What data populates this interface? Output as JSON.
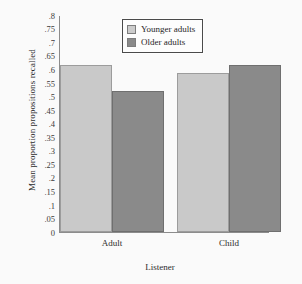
{
  "chart_data": {
    "type": "bar",
    "title": "",
    "xlabel": "Listener",
    "ylabel": "Mean proportion propositions recalled",
    "categories": [
      "Adult",
      "Child"
    ],
    "series": [
      {
        "name": "Younger adults",
        "color": "#c9c9c9",
        "values": [
          0.615,
          0.585
        ]
      },
      {
        "name": "Older adults",
        "color": "#8a8a8a",
        "values": [
          0.52,
          0.615
        ]
      }
    ],
    "ylim": [
      0,
      0.8
    ],
    "ytick_step": 0.05,
    "ytick_labels": [
      ".8",
      ".75",
      ".7",
      ".65",
      ".6",
      ".55",
      ".5",
      ".45",
      ".4",
      ".35",
      ".3",
      ".25",
      ".2",
      ".15",
      ".1",
      ".05",
      "0"
    ],
    "ytick_values": [
      0.8,
      0.75,
      0.7,
      0.65,
      0.6,
      0.55,
      0.5,
      0.45,
      0.4,
      0.35,
      0.3,
      0.25,
      0.2,
      0.15,
      0.1,
      0.05,
      0
    ],
    "grid": false,
    "legend_position": "top-center"
  }
}
